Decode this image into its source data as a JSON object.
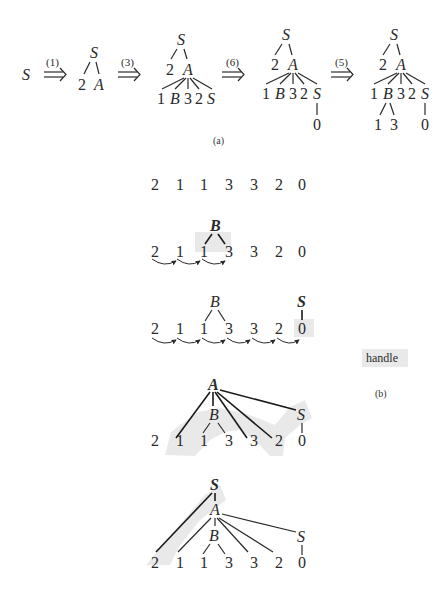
{
  "figure": {
    "part_a": {
      "caption": "(a)",
      "start_symbol": "S",
      "steps": [
        {
          "rule": "(1)"
        },
        {
          "rule": "(3)"
        },
        {
          "rule": "(6)"
        },
        {
          "rule": "(5)"
        }
      ],
      "trees": {
        "t1": {
          "root": "S",
          "children": [
            "2",
            "A"
          ]
        },
        "t2": {
          "root": "S",
          "mid": [
            "2",
            "A"
          ],
          "leaves": [
            "1",
            "B",
            "3",
            "2",
            "S"
          ]
        },
        "t3": {
          "root": "S",
          "mid": [
            "2",
            "A"
          ],
          "leaves": [
            "1",
            "B",
            "3",
            "2",
            "S"
          ],
          "s_child": "0"
        },
        "t4": {
          "root": "S",
          "mid": [
            "2",
            "A"
          ],
          "leaves": [
            "1",
            "B",
            "3",
            "2",
            "S"
          ],
          "b_children": [
            "1",
            "3"
          ],
          "s_child": "0"
        }
      }
    },
    "part_b": {
      "caption": "(b)",
      "handle_label": "handle",
      "input_string": [
        "2",
        "1",
        "1",
        "3",
        "3",
        "2",
        "0"
      ],
      "row2": {
        "node": "B",
        "tokens": [
          "2",
          "1",
          "1",
          "3",
          "3",
          "2",
          "0"
        ]
      },
      "row3": {
        "node_b": "B",
        "node_s": "S",
        "tokens": [
          "2",
          "1",
          "1",
          "3",
          "3",
          "2",
          "0"
        ]
      },
      "row4": {
        "node_a": "A",
        "node_b": "B",
        "node_s": "S",
        "tokens": [
          "2",
          "1",
          "1",
          "3",
          "3",
          "2",
          "0"
        ]
      },
      "row5": {
        "node_root": "S",
        "node_a": "A",
        "node_b": "B",
        "node_s": "S",
        "tokens": [
          "2",
          "1",
          "1",
          "3",
          "3",
          "2",
          "0"
        ]
      }
    }
  }
}
